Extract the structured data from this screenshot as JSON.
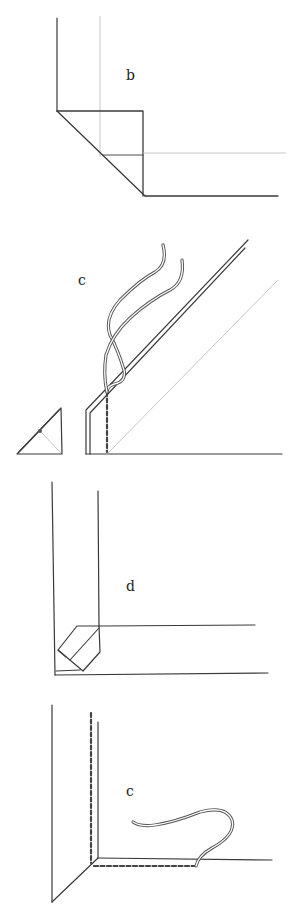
{
  "figure": {
    "steps": [
      {
        "id": "b",
        "label": "b"
      },
      {
        "id": "c",
        "label": "c"
      },
      {
        "id": "d",
        "label": "d"
      },
      {
        "id": "e",
        "label": "c"
      }
    ],
    "colors": {
      "ink": "#3a3a3a",
      "guide": "#b8b8b8",
      "background": "#ffffff"
    }
  }
}
